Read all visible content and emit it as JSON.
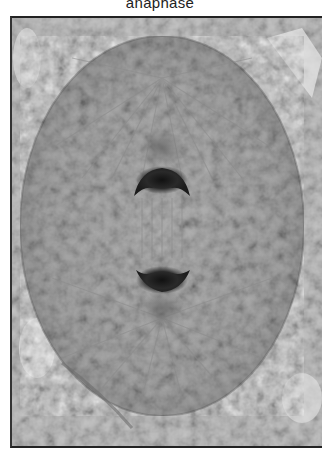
{
  "figure": {
    "caption": "anaphase",
    "colors": {
      "background": "#b9b9b9",
      "cell": "#a8a8a8",
      "chromosomes": "#1a1a1a",
      "frame": "#222222"
    }
  }
}
